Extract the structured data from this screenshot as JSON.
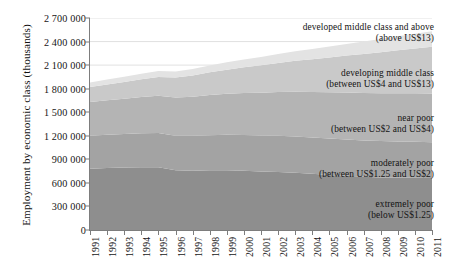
{
  "chart_data": {
    "type": "area",
    "stacked": true,
    "title": "",
    "xlabel": "",
    "ylabel": "Employment by economic class (thousands)",
    "grid": true,
    "legend_position": "inline-annotations",
    "ylim": [
      0,
      2700000
    ],
    "ytick_step": 300000,
    "ytick_labels": [
      "2 700 000",
      "2 400 000",
      "2 100 000",
      "1 800 000",
      "1 500 000",
      "1 200 000",
      "900 000",
      "600 000",
      "300 000",
      "0"
    ],
    "ytick_values": [
      2700000,
      2400000,
      2100000,
      1800000,
      1500000,
      1200000,
      900000,
      600000,
      300000,
      0
    ],
    "categories": [
      "1991",
      "1992",
      "1993",
      "1994",
      "1995",
      "1996",
      "1997",
      "1998",
      "1999",
      "2000",
      "2001",
      "2002",
      "2003",
      "2004",
      "2005",
      "2006",
      "2007",
      "2008",
      "2009",
      "2010",
      "2011"
    ],
    "x": [
      1991,
      1992,
      1993,
      1994,
      1995,
      1996,
      1997,
      1998,
      1999,
      2000,
      2001,
      2002,
      2003,
      2004,
      2005,
      2006,
      2007,
      2008,
      2009,
      2010,
      2011
    ],
    "series": [
      {
        "name": "extremely poor",
        "label_line1": "extremely poor",
        "label_line2": "(below US$1.25)",
        "color": "#8e8e8e",
        "values": [
          780000,
          790000,
          795000,
          800000,
          800000,
          760000,
          755000,
          760000,
          760000,
          755000,
          745000,
          740000,
          730000,
          715000,
          700000,
          690000,
          678000,
          670000,
          668000,
          665000,
          662000
        ]
      },
      {
        "name": "moderately poor",
        "label_line1": "moderately poor",
        "label_line2": "(between US$1.25 and US$2)",
        "color": "#a3a3a3",
        "values": [
          420000,
          424000,
          428000,
          432000,
          436000,
          440000,
          444000,
          448000,
          452000,
          455000,
          458000,
          460000,
          462000,
          463000,
          464000,
          464000,
          463000,
          462000,
          460000,
          458000,
          455000
        ]
      },
      {
        "name": "near poor",
        "label_line1": "near poor",
        "label_line2": "(between US$2 and US$4)",
        "color": "#b4b4b4",
        "values": [
          430000,
          440000,
          450000,
          462000,
          474000,
          486000,
          498000,
          510000,
          522000,
          534000,
          546000,
          558000,
          570000,
          580000,
          590000,
          598000,
          605000,
          610000,
          614000,
          618000,
          620000
        ]
      },
      {
        "name": "developing middle class",
        "label_line1": "developing middle class",
        "label_line2": "(between US$4 and US$13)",
        "color": "#c9c9c9",
        "values": [
          190000,
          200000,
          212000,
          226000,
          240000,
          256000,
          272000,
          290000,
          308000,
          328000,
          348000,
          370000,
          394000,
          418000,
          444000,
          470000,
          496000,
          522000,
          548000,
          572000,
          596000
        ]
      },
      {
        "name": "developed middle class and above",
        "label_line1": "developed middle class and above",
        "label_line2": "(above US$13)",
        "color": "#e3e3e3",
        "values": [
          60000,
          63000,
          66000,
          70000,
          74000,
          78000,
          83000,
          88000,
          94000,
          100000,
          107000,
          114000,
          122000,
          130000,
          139000,
          148000,
          158000,
          168000,
          178000,
          188000,
          198000
        ]
      }
    ],
    "annotations": [
      {
        "text": "developed middle class and above",
        "sub": "(above US$13)"
      },
      {
        "text": "developing middle class",
        "sub": "(between US$4 and US$13)"
      },
      {
        "text": "near poor",
        "sub": "(between US$2 and US$4)"
      },
      {
        "text": "moderately poor",
        "sub": "(between US$1.25 and US$2)"
      },
      {
        "text": "extremely poor",
        "sub": "(below US$1.25)"
      }
    ]
  },
  "colors": {
    "axis": "#7d7d7d",
    "grid": "#d9d9d9",
    "text": "#141414",
    "background": "#ffffff"
  }
}
